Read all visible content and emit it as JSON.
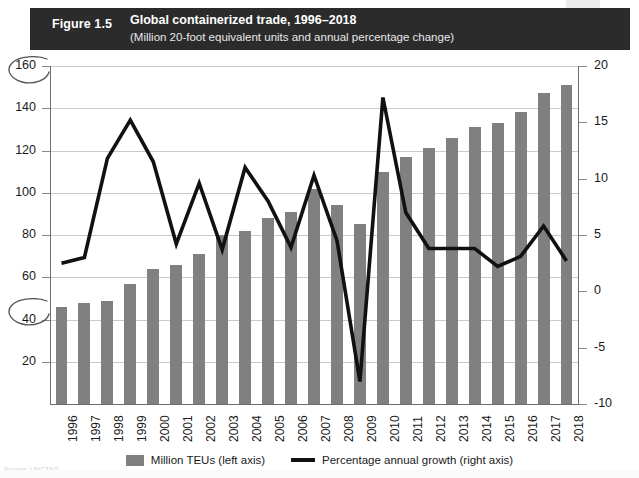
{
  "header": {
    "figure_number": "Figure 1.5",
    "title": "Global containerized trade, 1996–2018",
    "subtitle": "(Million 20-foot equivalent units and annual percentage change)",
    "band_color": "#2b2b2b"
  },
  "legend": {
    "position": "bottom-center",
    "items": [
      {
        "label": "Million TEUs (left axis)",
        "marker": "bar-swatch-icon",
        "color": "#808080"
      },
      {
        "label": "Percentage annual growth (right axis)",
        "marker": "line-swatch-icon",
        "color": "#111111"
      }
    ]
  },
  "axes": {
    "left_ticks": [
      "160",
      "140",
      "120",
      "100",
      "80",
      "60",
      "40",
      "20"
    ],
    "right_ticks": [
      "20",
      "15",
      "10",
      "5",
      "0",
      "-5",
      "-10"
    ]
  },
  "annotations": {
    "pencil_circle_160": "hand-drawn-ellipse",
    "pencil_circle_40": "hand-drawn-ellipse",
    "footnote": "Source: UNCTAD"
  },
  "chart_data": {
    "type": "bar",
    "title": "Global containerized trade, 1996–2018",
    "subtitle": "(Million 20-foot equivalent units and annual percentage change)",
    "xlabel": "",
    "ylabel": "Million TEUs",
    "y2label": "Percentage annual growth",
    "ylim": [
      0,
      160
    ],
    "y2lim": [
      -10,
      20
    ],
    "ytick_step": 20,
    "y2tick_step": 5,
    "grid": true,
    "categories": [
      "1996",
      "1997",
      "1998",
      "1999",
      "2000",
      "2001",
      "2002",
      "2003",
      "2004",
      "2005",
      "2006",
      "2007",
      "2008",
      "2009",
      "2010",
      "2011",
      "2012",
      "2013",
      "2014",
      "2015",
      "2016",
      "2017",
      "2018"
    ],
    "series": [
      {
        "name": "Million TEUs (left axis)",
        "type": "bar",
        "axis": "left",
        "color": "#808080",
        "values": [
          46,
          48,
          49,
          57,
          64,
          66,
          71,
          80,
          82,
          88,
          91,
          102,
          94,
          85,
          110,
          117,
          121,
          126,
          131,
          133,
          138,
          147,
          151
        ]
      },
      {
        "name": "Percentage annual growth (right axis)",
        "type": "line",
        "axis": "right",
        "color": "#111111",
        "values": [
          2.5,
          3.0,
          11.8,
          15.2,
          11.5,
          4.2,
          9.6,
          3.7,
          11.0,
          8.0,
          3.9,
          10.3,
          4.5,
          -8.0,
          17.2,
          7.0,
          3.8,
          3.8,
          3.8,
          2.2,
          3.1,
          5.8,
          2.7
        ]
      }
    ]
  }
}
